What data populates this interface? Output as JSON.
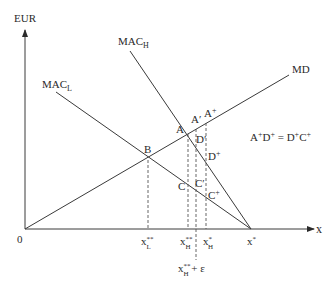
{
  "diagram": {
    "y_axis_label": "EUR",
    "x_axis_label": "x",
    "origin_label": "0",
    "curves": {
      "mac_h": {
        "label": "MAC",
        "sub": "H"
      },
      "mac_l": {
        "label": "MAC",
        "sub": "L"
      },
      "md": {
        "label": "MD"
      }
    },
    "points": {
      "A": "A",
      "A_prime": "A′",
      "A_plus": {
        "base": "A",
        "sup": "+"
      },
      "B": "B",
      "C": "C",
      "C_prime": "C′",
      "C_plus": {
        "base": "C",
        "sup": "+"
      },
      "D_prime": "D′",
      "D_plus": {
        "base": "D",
        "sup": "+"
      }
    },
    "x_ticks": {
      "xL_star_star": {
        "base": "x",
        "sub": "L",
        "sup": "**"
      },
      "xH_star_star": {
        "base": "x",
        "sub": "H",
        "sup": "**"
      },
      "xH_star": {
        "base": "x",
        "sub": "H",
        "sup": "*"
      },
      "x_star": {
        "base": "x",
        "sup": "*"
      },
      "xH_eps": {
        "base": "x",
        "sub": "H",
        "sup": "**",
        "suffix": " + ε"
      }
    },
    "equation": {
      "p1": "A",
      "s1": "+",
      "p2": "D",
      "s2": "+",
      "eq": " = ",
      "p3": "D",
      "s3": "+",
      "p4": "C",
      "s4": "+"
    }
  }
}
